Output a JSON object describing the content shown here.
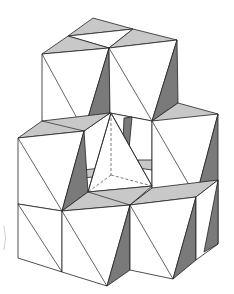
{
  "figure": {
    "title": "",
    "colors": {
      "face_white": "#ffffff",
      "face_light": "#c8c8c8",
      "face_dark": "#7a7a7a",
      "edge": "#222222"
    }
  }
}
